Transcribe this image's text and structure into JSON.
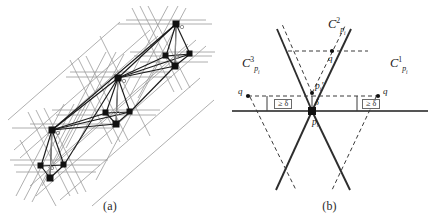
{
  "figure": {
    "panels": [
      {
        "id": "a",
        "caption": "(a)",
        "description": "arrangement of gray lines with dark graph clusters"
      },
      {
        "id": "b",
        "caption": "(b)",
        "description": "three cones around point p_i with delta separations"
      }
    ]
  },
  "panel_a": {
    "caption": "(a)",
    "line_color": "#9a9a9a",
    "graph_color": "#1a1a1a",
    "node_color": "#111111"
  },
  "panel_b": {
    "caption": "(b)",
    "cone_color": "#333333",
    "dash_color": "#444444",
    "axis_color": "#555555",
    "labels": {
      "cone1": {
        "base": "C",
        "sup": "1",
        "sub": "p",
        "subsub": "i"
      },
      "cone2": {
        "base": "C",
        "sup": "2",
        "sub": "p",
        "subsub": "i"
      },
      "cone3": {
        "base": "C",
        "sup": "3",
        "sub": "p",
        "subsub": "i"
      },
      "cone1_text": "C",
      "cone1_sup": "1",
      "cone1_sub": "pi",
      "cone2_text": "C",
      "cone2_sup": "2",
      "cone2_sub": "pi",
      "cone3_text": "C",
      "cone3_sup": "3",
      "cone3_sub": "pi",
      "p_i": "p",
      "p_i_sub": "i",
      "p_i_prime": "p",
      "p_i_prime_sub": "i",
      "p_i_prime_mark": "'",
      "q_top": "q",
      "q_left": "q",
      "q_right": "q",
      "delta_left": "≥ δ",
      "delta_right": "≥ δ",
      "delta_center": "δ"
    }
  }
}
